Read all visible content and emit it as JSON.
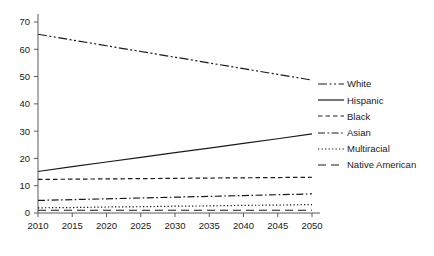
{
  "chart_data": {
    "type": "line",
    "title": "",
    "xlabel": "",
    "ylabel": "",
    "x": [
      2010,
      2015,
      2020,
      2025,
      2030,
      2035,
      2040,
      2045,
      2050
    ],
    "xlim": [
      2010,
      2050
    ],
    "ylim": [
      0,
      70
    ],
    "y_ticks": [
      0,
      10,
      20,
      30,
      40,
      50,
      60,
      70
    ],
    "x_ticks": [
      "2010",
      "2015",
      "2020",
      "2025",
      "2030",
      "2035",
      "2040",
      "2045",
      "2050"
    ],
    "grid": false,
    "legend_position": "right",
    "series": [
      {
        "name": "White",
        "dash_style": "dash-dot-dot",
        "values": [
          65.5,
          63.4,
          61.3,
          59.2,
          57.1,
          55.0,
          52.9,
          50.8,
          48.7
        ]
      },
      {
        "name": "Hispanic",
        "dash_style": "solid",
        "values": [
          15.2,
          17.0,
          18.7,
          20.4,
          22.1,
          23.8,
          25.5,
          27.2,
          29.0
        ]
      },
      {
        "name": "Black",
        "dash_style": "dashed",
        "values": [
          12.3,
          12.4,
          12.5,
          12.6,
          12.7,
          12.8,
          12.9,
          13.0,
          13.1
        ]
      },
      {
        "name": "Asian",
        "dash_style": "dash-dot",
        "values": [
          4.6,
          4.9,
          5.2,
          5.5,
          5.8,
          6.1,
          6.4,
          6.7,
          7.0
        ]
      },
      {
        "name": "Multiracial",
        "dash_style": "dotted",
        "values": [
          1.9,
          2.0,
          2.2,
          2.3,
          2.5,
          2.6,
          2.8,
          2.9,
          3.1
        ]
      },
      {
        "name": "Native American",
        "dash_style": "long-dash",
        "values": [
          1.0,
          1.0,
          1.0,
          1.0,
          1.0,
          1.0,
          1.0,
          1.0,
          1.0
        ]
      }
    ]
  },
  "legend": {
    "items": [
      {
        "label": "White"
      },
      {
        "label": "Hispanic"
      },
      {
        "label": "Black"
      },
      {
        "label": "Asian"
      },
      {
        "label": "Multiracial"
      },
      {
        "label": "Native American"
      }
    ]
  }
}
